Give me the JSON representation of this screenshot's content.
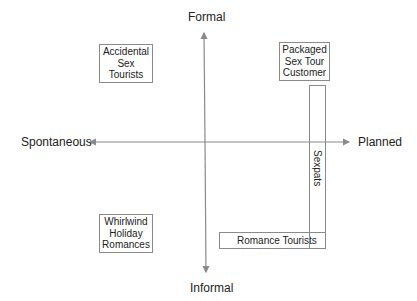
{
  "axes": {
    "top": "Formal",
    "bottom": "Informal",
    "left": "Spontaneous",
    "right": "Planned"
  },
  "quadrant_boxes": {
    "top_left": [
      "Accidental",
      "Sex",
      "Tourists"
    ],
    "top_right": [
      "Packaged",
      "Sex Tour",
      "Customer"
    ],
    "bottom_left": [
      "Whirlwind",
      "Holiday",
      "Romances"
    ]
  },
  "bars": {
    "vertical": "Sexpats",
    "horizontal": "Romance Tourists"
  },
  "colors": {
    "axis": "#8a8a8a",
    "box_border": "#8a8a8a",
    "text": "#222222"
  }
}
